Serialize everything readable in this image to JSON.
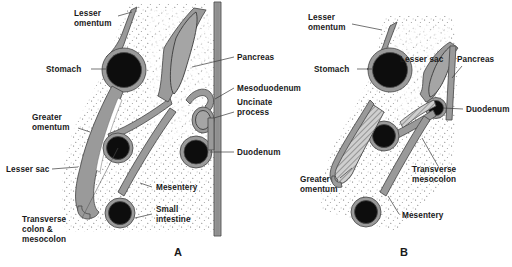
{
  "figure": {
    "background_color": "#ffffff",
    "membrane_color": "#9a9a9a",
    "lumen_color": "#0d0d0d",
    "outline_color": "#4a4a4a",
    "pancreas_color": "#a5a5a5",
    "text_color": "#1a1a1a"
  },
  "panels": [
    {
      "id": "panel-a",
      "letter": "A",
      "letter_x": 178,
      "letter_y": 256,
      "labels": [
        {
          "name": "lesser-omentum",
          "text_lines": [
            "Lesser",
            "omentum"
          ],
          "x": 74,
          "y": 16,
          "anchor": "start",
          "leader": "M 118 16 L 132 12"
        },
        {
          "name": "stomach",
          "text_lines": [
            "Stomach"
          ],
          "x": 46,
          "y": 72,
          "anchor": "start",
          "leader": "M 91 69 L 106 69"
        },
        {
          "name": "greater-omentum",
          "text_lines": [
            "Greater",
            "omentum"
          ],
          "x": 32,
          "y": 120,
          "anchor": "start",
          "leader": "M 78 128 L 90 132"
        },
        {
          "name": "lesser-sac",
          "text_lines": [
            "Lesser sac"
          ],
          "x": 6,
          "y": 172,
          "anchor": "start",
          "leader": "M 52 169 L 78 167"
        },
        {
          "name": "transverse-colon-mesocolon",
          "text_lines": [
            "Transverse",
            "colon &",
            "mesocolon"
          ],
          "x": 22,
          "y": 222,
          "anchor": "start",
          "leader": "M 82 218 L 118 148"
        },
        {
          "name": "mesentery",
          "text_lines": [
            "Mesentery"
          ],
          "x": 156,
          "y": 190,
          "anchor": "start",
          "leader": "M 152 187 L 140 183"
        },
        {
          "name": "small-intestine",
          "text_lines": [
            "Small",
            "intestine"
          ],
          "x": 156,
          "y": 212,
          "anchor": "start",
          "leader": "M 152 214 L 135 218"
        },
        {
          "name": "pancreas",
          "text_lines": [
            "Pancreas"
          ],
          "x": 237,
          "y": 60,
          "anchor": "start",
          "leader": "M 234 57 L 192 67"
        },
        {
          "name": "mesoduodenum",
          "text_lines": [
            "Mesoduodenum"
          ],
          "x": 237,
          "y": 91,
          "anchor": "start",
          "leader": "M 234 88 L 215 99"
        },
        {
          "name": "uncinate-process",
          "text_lines": [
            "Uncinate",
            "process"
          ],
          "x": 237,
          "y": 105,
          "anchor": "start",
          "leader": "M 234 112 L 214 118"
        },
        {
          "name": "duodenum",
          "text_lines": [
            "Duodenum"
          ],
          "x": 237,
          "y": 155,
          "anchor": "start",
          "leader": "M 234 152 L 210 152"
        }
      ]
    },
    {
      "id": "panel-b",
      "letter": "B",
      "letter_x": 404,
      "letter_y": 256,
      "labels": [
        {
          "name": "lesser-omentum",
          "text_lines": [
            "Lesser",
            "omentum"
          ],
          "x": 308,
          "y": 20,
          "anchor": "start",
          "leader": "M 352 24 L 382 30"
        },
        {
          "name": "stomach",
          "text_lines": [
            "Stomach"
          ],
          "x": 314,
          "y": 72,
          "anchor": "start",
          "leader": "M 357 69 L 372 69"
        },
        {
          "name": "lesser-sac",
          "text_lines": [
            "Lesser sac"
          ],
          "x": 400,
          "y": 62,
          "anchor": "start",
          "leader": ""
        },
        {
          "name": "pancreas",
          "text_lines": [
            "Pancreas"
          ],
          "x": 457,
          "y": 62,
          "anchor": "start",
          "leader": "M 462 66 L 452 78"
        },
        {
          "name": "duodenum",
          "text_lines": [
            "Duodenum"
          ],
          "x": 466,
          "y": 112,
          "anchor": "start",
          "leader": "M 463 109 L 443 108"
        },
        {
          "name": "greater-omentum",
          "text_lines": [
            "Greater",
            "omentum"
          ],
          "x": 300,
          "y": 182,
          "anchor": "start",
          "leader": "M 340 178 L 352 168"
        },
        {
          "name": "transverse-mesocolon",
          "text_lines": [
            "Transverse",
            "mesocolon"
          ],
          "x": 412,
          "y": 172,
          "anchor": "start",
          "leader": "M 438 166 L 422 138"
        },
        {
          "name": "mesentery",
          "text_lines": [
            "Mesentery"
          ],
          "x": 402,
          "y": 218,
          "anchor": "start",
          "leader": "M 399 214 L 388 196"
        }
      ]
    }
  ]
}
